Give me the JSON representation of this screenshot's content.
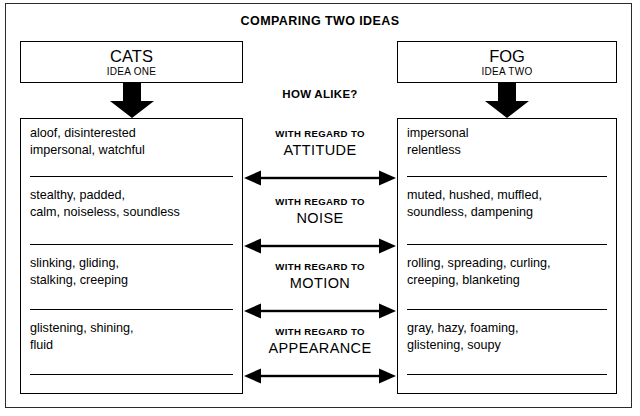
{
  "diagram": {
    "title": "COMPARING TWO IDEAS",
    "center_prompt": "HOW ALIKE?",
    "ideas": [
      {
        "name": "CATS",
        "subtitle": "IDEA ONE"
      },
      {
        "name": "FOG",
        "subtitle": "IDEA TWO"
      }
    ],
    "comparison_label_prefix": "WITH REGARD TO",
    "rows": [
      {
        "aspect": "ATTITUDE",
        "prefix": "WITH REGARD TO",
        "left_lines": [
          "aloof, disinterested",
          "impersonal, watchful"
        ],
        "right_lines": [
          "impersonal",
          "relentless"
        ]
      },
      {
        "aspect": "NOISE",
        "prefix": "WITH REGARD TO",
        "left_lines": [
          "stealthy, padded,",
          "calm, noiseless, soundless"
        ],
        "right_lines": [
          "muted, hushed, muffled,",
          "soundless, dampening"
        ]
      },
      {
        "aspect": "MOTION",
        "prefix": "WITH REGARD TO",
        "left_lines": [
          "slinking, gliding,",
          "stalking, creeping"
        ],
        "right_lines": [
          "rolling, spreading, curling,",
          "creeping, blanketing"
        ]
      },
      {
        "aspect": "APPEARANCE",
        "prefix": "WITH REGARD TO",
        "left_lines": [
          "glistening, shining,",
          "fluid"
        ],
        "right_lines": [
          "gray, hazy, foaming,",
          "glistening, soupy"
        ]
      }
    ],
    "icons": {
      "left_flow": "down-arrow-icon",
      "right_flow": "down-arrow-icon",
      "comparison": "double-headed-arrow-icon"
    },
    "colors": {
      "ink": "#000000",
      "frame": "#2b2b2b",
      "paper": "#ffffff"
    }
  }
}
